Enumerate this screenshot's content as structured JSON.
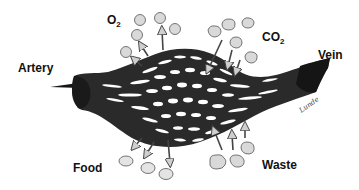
{
  "diagram": {
    "labels": {
      "artery": "Artery",
      "vein": "Vein",
      "oxygen_main": "O",
      "oxygen_sub": "2",
      "carbon_dioxide_main": "CO",
      "carbon_dioxide_sub": "2",
      "food": "Food",
      "waste": "Waste"
    },
    "signature": "Lunde",
    "colors": {
      "vessel": "#2a2a2a",
      "vessel_dark": "#151515",
      "gap": "#ffffff",
      "molecule_fill": "#d9d9d9",
      "molecule_stroke": "#555555",
      "arrow_fill": "#cfcfcf",
      "arrow_stroke": "#444444"
    },
    "molecules": {
      "oxygen": [
        [
          140,
          20
        ],
        [
          160,
          18
        ],
        [
          137,
          35
        ],
        [
          132,
          51
        ],
        [
          175,
          27
        ]
      ],
      "carbon_dioxide": [
        [
          214,
          30
        ],
        [
          228,
          24
        ],
        [
          248,
          22
        ],
        [
          236,
          42
        ],
        [
          251,
          58
        ]
      ],
      "food": [
        [
          126,
          164
        ],
        [
          147,
          173
        ],
        [
          166,
          179
        ]
      ],
      "waste": [
        [
          222,
          160
        ],
        [
          239,
          160
        ],
        [
          250,
          148
        ]
      ]
    }
  }
}
